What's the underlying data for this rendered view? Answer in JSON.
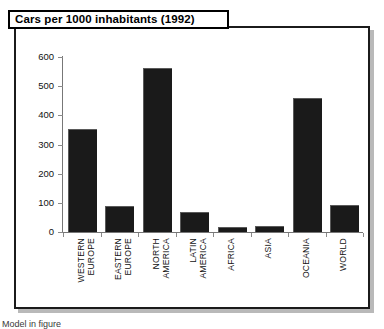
{
  "chart": {
    "title": "Cars per 1000 inhabitants (1992)",
    "bottom_caption": "Model in figure"
  },
  "chart_data": {
    "type": "bar",
    "title": "Cars per 1000 inhabitants (1992)",
    "xlabel": "",
    "ylabel": "",
    "ylim": [
      0,
      600
    ],
    "yticks": [
      0,
      100,
      200,
      300,
      400,
      500,
      600
    ],
    "ytick_labels": [
      "0",
      "100",
      "200",
      "300",
      "400",
      "500",
      "600"
    ],
    "grid": false,
    "legend": false,
    "bar_color": "#1a1a1a",
    "categories": [
      "WESTERN EUROPE",
      "EASTERN EUROPE",
      "NORTH AMERICA",
      "LATIN AMERICA",
      "AFRICA",
      "ASIA",
      "OCEANIA",
      "WORLD"
    ],
    "category_lines": [
      [
        "WESTERN",
        "EUROPE"
      ],
      [
        "EASTERN",
        "EUROPE"
      ],
      [
        "NORTH",
        "AMERICA"
      ],
      [
        "LATIN",
        "AMERICA"
      ],
      [
        "AFRICA",
        ""
      ],
      [
        "ASIA",
        ""
      ],
      [
        "OCEANIA",
        ""
      ],
      [
        "WORLD",
        ""
      ]
    ],
    "values": [
      350,
      85,
      560,
      65,
      15,
      18,
      455,
      88
    ]
  }
}
